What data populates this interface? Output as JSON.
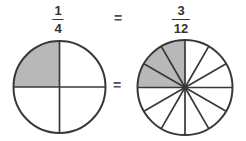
{
  "figure": {
    "left_fraction": {
      "numerator": "1",
      "denominator": "4"
    },
    "right_fraction": {
      "numerator": "3",
      "denominator": "12"
    },
    "equals_top": "=",
    "equals_middle": "=",
    "circles": {
      "left": {
        "label": "one-fourth circle model",
        "total_sectors": 4,
        "shaded_sectors": 1,
        "start_angle_deg": 90,
        "center_dot": false
      },
      "right": {
        "label": "three-twelfths circle model",
        "total_sectors": 12,
        "shaded_sectors": 3,
        "start_angle_deg": 90,
        "center_dot": true
      }
    },
    "colors": {
      "shaded_fill": "#b8b8b8",
      "unshaded_fill": "#ffffff",
      "circle_stroke": "#383838",
      "text": "#333333",
      "equals": "#4d4d4d",
      "background": "#ffffff"
    }
  },
  "chart_data": [
    {
      "type": "pie",
      "title": "1/4",
      "categories": [
        "shaded",
        "unshaded"
      ],
      "values": [
        1,
        3
      ],
      "total_sectors": 4,
      "note": "1 of 4 equal sectors shaded, upper-left quadrant"
    },
    {
      "type": "pie",
      "title": "3/12",
      "categories": [
        "shaded",
        "unshaded"
      ],
      "values": [
        3,
        9
      ],
      "total_sectors": 12,
      "note": "3 of 12 equal sectors shaded, upper-left quadrant"
    }
  ]
}
